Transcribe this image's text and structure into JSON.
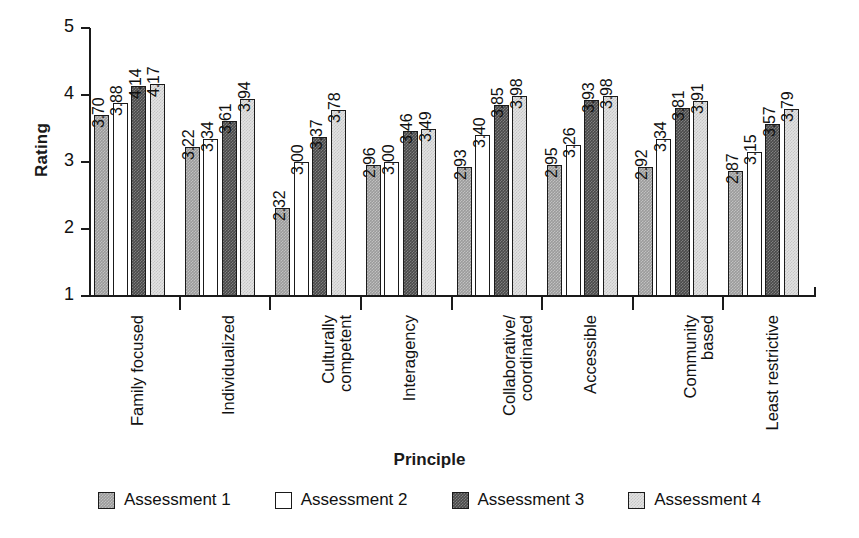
{
  "chart_data": {
    "type": "bar",
    "title": "",
    "xlabel": "Principle",
    "ylabel": "Rating",
    "ylim": [
      1,
      5
    ],
    "yticks": [
      1,
      2,
      3,
      4,
      5
    ],
    "grid": false,
    "legend_position": "bottom",
    "categories": [
      "Family focused",
      "Individualized",
      "Culturally competent",
      "Interagency",
      "Collaborative/ coordinated",
      "Accessible",
      "Community based",
      "Least restrictive"
    ],
    "category_lines": [
      [
        "Family focused"
      ],
      [
        "Individualized"
      ],
      [
        "Culturally",
        "competent"
      ],
      [
        "Interagency"
      ],
      [
        "Collaborative/",
        "coordinated"
      ],
      [
        "Accessible"
      ],
      [
        "Community",
        "based"
      ],
      [
        "Least restrictive"
      ]
    ],
    "series": [
      {
        "name": "Assessment 1",
        "color": "#9b9b9b",
        "values": [
          3.7,
          3.22,
          2.32,
          2.96,
          2.93,
          2.95,
          2.92,
          2.87
        ],
        "labels": [
          "3.70",
          "3.22",
          "2.32",
          "2.96",
          "2.93",
          "2.95",
          "2.92",
          "2.87"
        ]
      },
      {
        "name": "Assessment 2",
        "color": "#ffffff",
        "values": [
          3.88,
          3.34,
          3.0,
          3.0,
          3.4,
          3.26,
          3.34,
          3.15
        ],
        "labels": [
          "3.88",
          "3.34",
          "3.00",
          "3.00",
          "3.40",
          "3.26",
          "3.34",
          "3.15"
        ]
      },
      {
        "name": "Assessment 3",
        "color": "#4a4a4a",
        "values": [
          4.14,
          3.61,
          3.37,
          3.46,
          3.85,
          3.93,
          3.81,
          3.57
        ],
        "labels": [
          "4.14",
          "3.61",
          "3.37",
          "3.46",
          "3.85",
          "3.93",
          "3.81",
          "3.57"
        ]
      },
      {
        "name": "Assessment 4",
        "color": "#e2e2e2",
        "values": [
          4.17,
          3.94,
          3.78,
          3.49,
          3.98,
          3.98,
          3.91,
          3.79
        ],
        "labels": [
          "4.17",
          "3.94",
          "3.78",
          "3.49",
          "3.98",
          "3.98",
          "3.91",
          "3.79"
        ]
      }
    ]
  },
  "legend": {
    "items": [
      {
        "label": "Assessment 1"
      },
      {
        "label": "Assessment 2"
      },
      {
        "label": "Assessment 3"
      },
      {
        "label": "Assessment 4"
      }
    ]
  },
  "axes": {
    "y_title": "Rating",
    "x_title": "Principle",
    "y_tick_labels": [
      "5",
      "4",
      "3",
      "2",
      "1"
    ]
  }
}
